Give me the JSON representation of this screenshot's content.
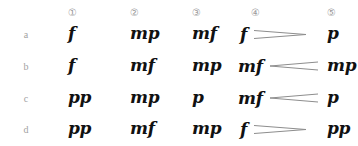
{
  "table": {
    "column_headers": [
      "①",
      "②",
      "③",
      "④",
      "⑤"
    ],
    "row_labels": [
      "a",
      "b",
      "c",
      "d"
    ],
    "rows": [
      {
        "label": "a",
        "cells": [
          {
            "dynamic": "f",
            "hairpin": "none"
          },
          {
            "dynamic": "mp",
            "hairpin": "none"
          },
          {
            "dynamic": "mf",
            "hairpin": "none"
          },
          {
            "dynamic": "f",
            "hairpin": "diminuendo"
          },
          {
            "dynamic": "p",
            "hairpin": "none"
          }
        ]
      },
      {
        "label": "b",
        "cells": [
          {
            "dynamic": "f",
            "hairpin": "none"
          },
          {
            "dynamic": "mf",
            "hairpin": "none"
          },
          {
            "dynamic": "mp",
            "hairpin": "none"
          },
          {
            "dynamic": "mf",
            "hairpin": "crescendo"
          },
          {
            "dynamic": "mp",
            "hairpin": "none"
          }
        ]
      },
      {
        "label": "c",
        "cells": [
          {
            "dynamic": "pp",
            "hairpin": "none"
          },
          {
            "dynamic": "mp",
            "hairpin": "none"
          },
          {
            "dynamic": "p",
            "hairpin": "none"
          },
          {
            "dynamic": "mf",
            "hairpin": "crescendo"
          },
          {
            "dynamic": "p",
            "hairpin": "none"
          }
        ]
      },
      {
        "label": "d",
        "cells": [
          {
            "dynamic": "pp",
            "hairpin": "none"
          },
          {
            "dynamic": "mf",
            "hairpin": "none"
          },
          {
            "dynamic": "mp",
            "hairpin": "none"
          },
          {
            "dynamic": "f",
            "hairpin": "diminuendo"
          },
          {
            "dynamic": "pp",
            "hairpin": "none"
          }
        ]
      }
    ]
  },
  "colors": {
    "background": "#ffffff",
    "dynamic_text": "#111111",
    "label_text": "#a2a2a2",
    "header_text": "#9a9a9a",
    "hairpin_stroke": "#8d8d8d"
  }
}
